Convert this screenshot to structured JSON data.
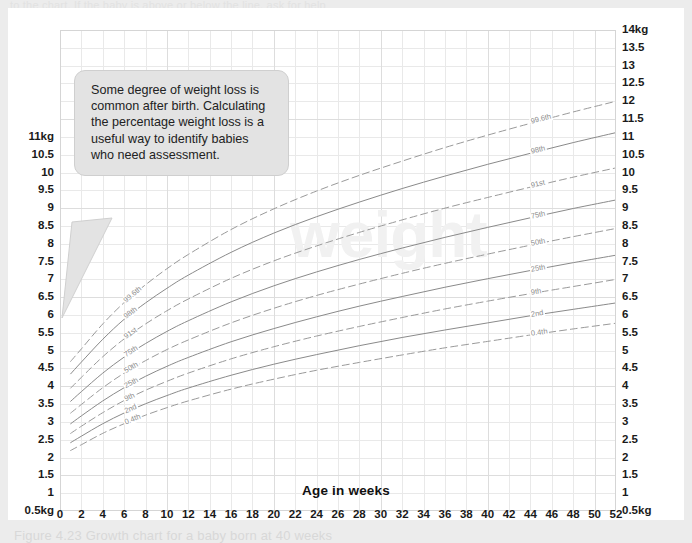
{
  "page": {
    "edge_top_text": "to the chart. If the baby is above or below the line, ask for help",
    "edge_bottom_text": "Figure 4.23  Growth chart for a baby born at 40 weeks"
  },
  "callout": {
    "text": "Some degree of weight loss is common after birth. Calculating the percentage weight loss is a useful way to identify babies who need assessment."
  },
  "watermark": {
    "text": "weight"
  },
  "chart_data": {
    "type": "line",
    "title": "",
    "xlabel": "Age in weeks",
    "ylabel": "kg",
    "xlim": [
      0,
      52
    ],
    "ylim": [
      0.5,
      14
    ],
    "grid": true,
    "legend_position": "inline-on-curve",
    "x_ticks": [
      0,
      2,
      4,
      6,
      8,
      10,
      12,
      14,
      16,
      18,
      20,
      22,
      24,
      26,
      28,
      30,
      32,
      34,
      36,
      38,
      40,
      42,
      44,
      46,
      48,
      50,
      52
    ],
    "y_ticks_left": [
      "11kg",
      "10.5",
      "10",
      "9.5",
      "9",
      "8.5",
      "8",
      "7.5",
      "7",
      "6.5",
      "6",
      "5.5",
      "5",
      "4.5",
      "4",
      "3.5",
      "3",
      "2.5",
      "2",
      "1.5",
      "1",
      "0.5kg"
    ],
    "y_ticks_left_values": [
      11,
      10.5,
      10,
      9.5,
      9,
      8.5,
      8,
      7.5,
      7,
      6.5,
      6,
      5.5,
      5,
      4.5,
      4,
      3.5,
      3,
      2.5,
      2,
      1.5,
      1,
      0.5
    ],
    "y_ticks_right": [
      "14kg",
      "13.5",
      "13",
      "12.5",
      "12",
      "11.5",
      "11",
      "10.5",
      "10",
      "9.5",
      "9",
      "8.5",
      "8",
      "7.5",
      "7",
      "6.5",
      "6",
      "5.5",
      "5",
      "4.5",
      "4",
      "3.5",
      "3",
      "2.5",
      "2",
      "1.5",
      "1",
      "0.5kg"
    ],
    "y_ticks_right_values": [
      14,
      13.5,
      13,
      12.5,
      12,
      11.5,
      11,
      10.5,
      10,
      9.5,
      9,
      8.5,
      8,
      7.5,
      7,
      6.5,
      6,
      5.5,
      5,
      4.5,
      4,
      3.5,
      3,
      2.5,
      2,
      1.5,
      1,
      0.5
    ],
    "x": [
      1,
      2,
      4,
      6,
      8,
      10,
      12,
      16,
      20,
      24,
      28,
      32,
      36,
      40,
      44,
      48,
      52
    ],
    "series": [
      {
        "name": "99.6th",
        "style": "dashed",
        "color": "#9a9a9a",
        "values": [
          4.7,
          5.05,
          5.75,
          6.35,
          6.85,
          7.3,
          7.7,
          8.4,
          8.98,
          9.48,
          9.92,
          10.32,
          10.7,
          11.05,
          11.38,
          11.7,
          12.0
        ]
      },
      {
        "name": "98th",
        "style": "solid",
        "color": "#8a8a8a",
        "values": [
          4.35,
          4.68,
          5.32,
          5.88,
          6.34,
          6.75,
          7.12,
          7.76,
          8.3,
          8.76,
          9.17,
          9.55,
          9.9,
          10.23,
          10.54,
          10.84,
          11.12
        ]
      },
      {
        "name": "91st",
        "style": "dashed",
        "color": "#9a9a9a",
        "values": [
          3.95,
          4.25,
          4.83,
          5.33,
          5.75,
          6.12,
          6.45,
          7.03,
          7.52,
          7.94,
          8.32,
          8.67,
          9.0,
          9.3,
          9.59,
          9.87,
          10.13
        ]
      },
      {
        "name": "75th",
        "style": "solid",
        "color": "#8a8a8a",
        "values": [
          3.58,
          3.85,
          4.37,
          4.82,
          5.2,
          5.54,
          5.84,
          6.37,
          6.82,
          7.21,
          7.56,
          7.88,
          8.18,
          8.46,
          8.73,
          8.99,
          9.23
        ]
      },
      {
        "name": "50th",
        "style": "dashed",
        "color": "#9a9a9a",
        "values": [
          3.25,
          3.49,
          3.96,
          4.37,
          4.72,
          5.03,
          5.3,
          5.78,
          6.19,
          6.55,
          6.87,
          7.17,
          7.45,
          7.71,
          7.96,
          8.2,
          8.43
        ]
      },
      {
        "name": "25th",
        "style": "solid",
        "color": "#8a8a8a",
        "values": [
          2.95,
          3.17,
          3.59,
          3.96,
          4.28,
          4.56,
          4.81,
          5.25,
          5.62,
          5.95,
          6.25,
          6.52,
          6.78,
          7.02,
          7.25,
          7.47,
          7.68
        ]
      },
      {
        "name": "9th",
        "style": "dashed",
        "color": "#9a9a9a",
        "values": [
          2.68,
          2.88,
          3.26,
          3.6,
          3.89,
          4.14,
          4.37,
          4.77,
          5.11,
          5.41,
          5.68,
          5.93,
          6.17,
          6.39,
          6.6,
          6.8,
          7.0
        ]
      },
      {
        "name": "2nd",
        "style": "solid",
        "color": "#8a8a8a",
        "values": [
          2.42,
          2.6,
          2.95,
          3.25,
          3.51,
          3.74,
          3.95,
          4.31,
          4.62,
          4.89,
          5.14,
          5.37,
          5.58,
          5.78,
          5.98,
          6.16,
          6.34
        ]
      },
      {
        "name": "0.4th",
        "style": "dashed",
        "color": "#9a9a9a",
        "values": [
          2.2,
          2.36,
          2.68,
          2.95,
          3.19,
          3.4,
          3.59,
          3.92,
          4.2,
          4.45,
          4.67,
          4.88,
          5.08,
          5.26,
          5.44,
          5.61,
          5.77
        ]
      }
    ]
  }
}
